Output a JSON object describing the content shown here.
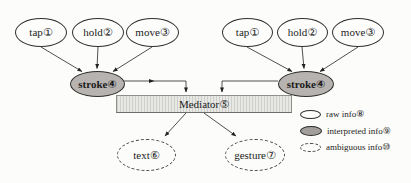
{
  "nodes": [
    {
      "id": "tap-left",
      "label": "tap①"
    },
    {
      "id": "hold-left",
      "label": "hold②"
    },
    {
      "id": "move-left",
      "label": "move③"
    },
    {
      "id": "stroke-left",
      "label": "stroke④"
    },
    {
      "id": "tap-right",
      "label": "tap①"
    },
    {
      "id": "hold-right",
      "label": "hold②"
    },
    {
      "id": "move-right",
      "label": "move③"
    },
    {
      "id": "stroke-right",
      "label": "stroke④"
    },
    {
      "id": "mediator",
      "label": "Mediator⑤"
    },
    {
      "id": "text-output",
      "label": "text⑥"
    },
    {
      "id": "gesture-output",
      "label": "gesture⑦"
    }
  ],
  "legend": {
    "items": [
      {
        "id": "raw",
        "label": "raw info⑧"
      },
      {
        "id": "interpreted",
        "label": "interpreted info⑨"
      },
      {
        "id": "ambiguous",
        "label": "ambiguous info⑩"
      }
    ]
  },
  "colors": {
    "raw_fill": "#fdfdfc",
    "interpreted_fill": "#b6b3b0",
    "mediator_fill": "#e7e7e4",
    "outline": "#2e2e2e"
  }
}
